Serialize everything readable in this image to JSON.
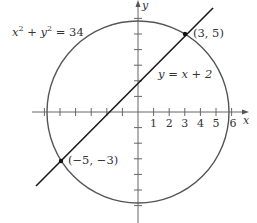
{
  "figure": {
    "origin_px": [
      138,
      112
    ],
    "unit_px": 15.6,
    "colors": {
      "circle": "#555555",
      "line": "#1a1a1a",
      "axes": "#666666",
      "text": "#333333"
    }
  },
  "axes": {
    "x_label": "x",
    "y_label": "y",
    "x_tick_labels": [
      "1",
      "2",
      "3",
      "4",
      "5",
      "6"
    ],
    "x_ticks": [
      -6,
      -5,
      -4,
      -3,
      -2,
      -1,
      1,
      2,
      3,
      4,
      5,
      6
    ],
    "y_ticks": [
      -6,
      -5,
      -4,
      -3,
      -2,
      -1,
      1,
      2,
      3,
      4,
      5,
      6
    ]
  },
  "curves": {
    "circle": {
      "label_parts": [
        "x",
        "2",
        " + ",
        "y",
        "2",
        " = 34"
      ],
      "equation": "x^2 + y^2 = 34",
      "radius_squared": 34
    },
    "line": {
      "label": "y = x + 2",
      "slope": 1,
      "intercept": 2,
      "x_range": [
        -6.5,
        4.8
      ]
    }
  },
  "points": [
    {
      "x": 3,
      "y": 5,
      "label": "(3, 5)"
    },
    {
      "x": -5,
      "y": -3,
      "label": "(−5, −3)"
    }
  ]
}
